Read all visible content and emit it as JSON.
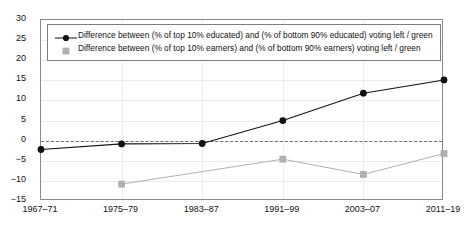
{
  "chart_data": {
    "type": "line",
    "title": "",
    "subtitle": "",
    "xlabel": "",
    "ylabel": "",
    "categories": [
      "1967–71",
      "1975–79",
      "1983–87",
      "1991–99",
      "2003–07",
      "2011–19"
    ],
    "ylim": [
      -15,
      30
    ],
    "yticks": [
      30,
      25,
      20,
      15,
      10,
      5,
      0,
      -5,
      -10,
      -15
    ],
    "ytick_labels": [
      "30",
      "25",
      "20",
      "15",
      "10",
      "5",
      "0",
      "−5",
      "−10",
      "−15"
    ],
    "grid": true,
    "legend_position": "top-left",
    "reference_line": {
      "value": 0,
      "style": "dashed",
      "color": "#6e6e6e"
    },
    "series": [
      {
        "name": "Difference between (% of top 10% educated) and (% of bottom 90% educated) voting left / green",
        "color": "#111111",
        "marker": "circle",
        "values": [
          -2.2,
          -0.8,
          -0.7,
          5.0,
          11.8,
          15.1
        ]
      },
      {
        "name": "Difference between (% of top 10% earners) and (% of bottom 90% earners) voting left / green",
        "color": "#b0b0b0",
        "marker": "square",
        "values": [
          null,
          -10.8,
          null,
          -4.6,
          -8.4,
          -3.2
        ]
      }
    ]
  },
  "legend": {
    "entries": [
      {
        "label": "Difference between (% of top 10% educated) and (% of bottom 90% educated) voting left / green",
        "marker": "circle-line-marker",
        "color": "#111111"
      },
      {
        "label": "Difference between (% of top 10% earners) and (% of bottom 90% earners) voting left / green",
        "marker": "square-marker",
        "color": "#b0b0b0"
      }
    ]
  }
}
